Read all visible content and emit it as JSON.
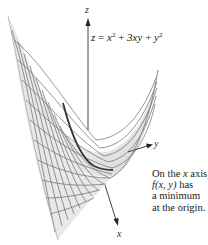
{
  "figure": {
    "equation": {
      "lhs": "z",
      "equals": "=",
      "term1_var": "x",
      "term1_exp": "2",
      "plus1": "+",
      "term2": "3xy",
      "plus2": "+",
      "term3_var": "y",
      "term3_exp": "2"
    },
    "axes": {
      "z_label": "z",
      "y_label": "y",
      "x_label": "x"
    },
    "caption": {
      "line1_a": "On the ",
      "line1_var": "x",
      "line1_b": " axis,",
      "line2_f": "f",
      "line2_args": "(x, y)",
      "line2_b": " has",
      "line3": "a minimum",
      "line4": "at the origin."
    },
    "colors": {
      "surface_fill": "#e4e4e4",
      "grid_lines": "#555555",
      "highlight_curve": "#333333",
      "axis": "#444444"
    }
  }
}
